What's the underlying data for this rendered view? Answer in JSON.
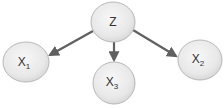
{
  "diagram": {
    "type": "directed-graph",
    "nodes": [
      {
        "id": "Z",
        "label": "Z",
        "sub": "",
        "cx": 113,
        "cy": 22,
        "rx": 22,
        "ry": 20
      },
      {
        "id": "X1",
        "label": "X",
        "sub": "1",
        "cx": 26,
        "cy": 62,
        "rx": 23,
        "ry": 20
      },
      {
        "id": "X3",
        "label": "X",
        "sub": "3",
        "cx": 114,
        "cy": 83,
        "rx": 21,
        "ry": 21
      },
      {
        "id": "X2",
        "label": "X",
        "sub": "2",
        "cx": 200,
        "cy": 60,
        "rx": 22,
        "ry": 20
      }
    ],
    "edges": [
      {
        "from": "Z",
        "to": "X1"
      },
      {
        "from": "Z",
        "to": "X3"
      },
      {
        "from": "Z",
        "to": "X2"
      }
    ],
    "colors": {
      "node_fill_center": "#f4f4f4",
      "node_fill_edge": "#d8d8d8",
      "node_stroke": "#b0b0b0",
      "edge": "#606060",
      "text": "#333333"
    }
  }
}
